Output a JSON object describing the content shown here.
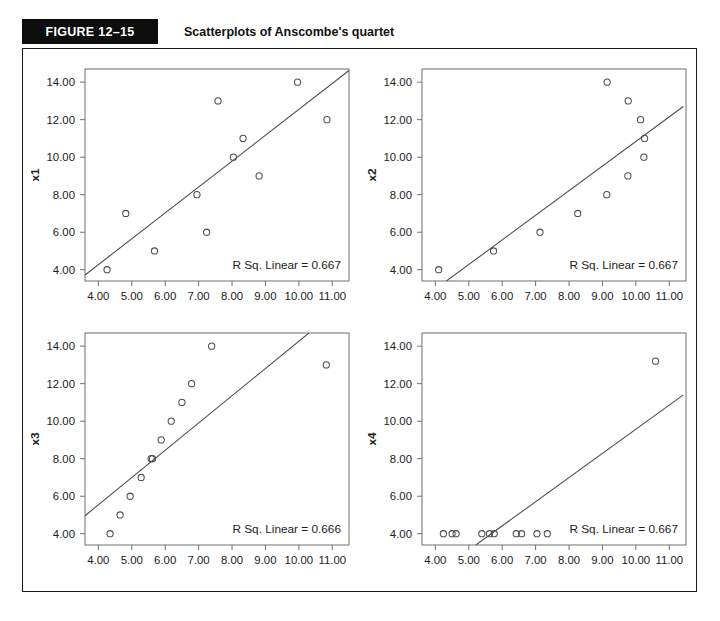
{
  "header": {
    "figure_tag": "FIGURE 12–15",
    "title": "Scatterplots of Anscombe's quartet"
  },
  "chart_data": [
    {
      "id": "panel-x1",
      "type": "scatter",
      "title": "",
      "xlabel": "",
      "ylabel": "x1",
      "xlim": [
        3.6,
        11.5
      ],
      "ylim": [
        3.4,
        14.7
      ],
      "xticks": [
        4.0,
        5.0,
        6.0,
        7.0,
        8.0,
        9.0,
        10.0,
        11.0
      ],
      "xticklabels": [
        "4.00",
        "5.00",
        "6.00",
        "7.00",
        "8.00",
        "9.00",
        "10.00",
        "11.00"
      ],
      "yticks": [
        4.0,
        6.0,
        8.0,
        10.0,
        12.0,
        14.0
      ],
      "yticklabels": [
        "4.00",
        "6.00",
        "8.00",
        "10.00",
        "12.00",
        "14.00"
      ],
      "grid": false,
      "annotation": "R Sq. Linear = 0.667",
      "points": [
        {
          "x": 4.26,
          "y": 4.0
        },
        {
          "x": 4.82,
          "y": 7.0
        },
        {
          "x": 5.68,
          "y": 5.0
        },
        {
          "x": 6.95,
          "y": 8.0
        },
        {
          "x": 7.24,
          "y": 6.0
        },
        {
          "x": 7.58,
          "y": 13.0
        },
        {
          "x": 8.04,
          "y": 10.0
        },
        {
          "x": 8.33,
          "y": 11.0
        },
        {
          "x": 8.81,
          "y": 9.0
        },
        {
          "x": 9.96,
          "y": 14.0
        },
        {
          "x": 10.84,
          "y": 12.0
        }
      ],
      "fit_line": {
        "x0": 3.6,
        "y0": 3.72,
        "x1": 11.5,
        "y1": 14.62
      }
    },
    {
      "id": "panel-x2",
      "type": "scatter",
      "title": "",
      "xlabel": "",
      "ylabel": "x2",
      "xlim": [
        3.6,
        11.5
      ],
      "ylim": [
        3.4,
        14.7
      ],
      "xticks": [
        4.0,
        5.0,
        6.0,
        7.0,
        8.0,
        9.0,
        10.0,
        11.0
      ],
      "xticklabels": [
        "4.00",
        "5.00",
        "6.00",
        "7.00",
        "8.00",
        "9.00",
        "10.00",
        "11.00"
      ],
      "yticks": [
        4.0,
        6.0,
        8.0,
        10.0,
        12.0,
        14.0
      ],
      "yticklabels": [
        "4.00",
        "6.00",
        "8.00",
        "10.00",
        "12.00",
        "14.00"
      ],
      "grid": false,
      "annotation": "R Sq. Linear = 0.667",
      "points": [
        {
          "x": 4.1,
          "y": 4.0
        },
        {
          "x": 5.74,
          "y": 5.0
        },
        {
          "x": 7.13,
          "y": 6.0
        },
        {
          "x": 8.26,
          "y": 7.0
        },
        {
          "x": 9.13,
          "y": 8.0
        },
        {
          "x": 9.14,
          "y": 14.0
        },
        {
          "x": 9.76,
          "y": 9.0
        },
        {
          "x": 9.77,
          "y": 13.0
        },
        {
          "x": 10.14,
          "y": 12.0
        },
        {
          "x": 10.24,
          "y": 10.0
        },
        {
          "x": 10.26,
          "y": 11.0
        }
      ],
      "fit_line": {
        "x0": 4.33,
        "y0": 3.4,
        "x1": 11.42,
        "y1": 12.7
      }
    },
    {
      "id": "panel-x3",
      "type": "scatter",
      "title": "",
      "xlabel": "",
      "ylabel": "x3",
      "xlim": [
        3.6,
        11.5
      ],
      "ylim": [
        3.4,
        14.7
      ],
      "xticks": [
        4.0,
        5.0,
        6.0,
        7.0,
        8.0,
        9.0,
        10.0,
        11.0
      ],
      "xticklabels": [
        "4.00",
        "5.00",
        "6.00",
        "7.00",
        "8.00",
        "9.00",
        "10.00",
        "11.00"
      ],
      "yticks": [
        4.0,
        6.0,
        8.0,
        10.0,
        12.0,
        14.0
      ],
      "yticklabels": [
        "4.00",
        "6.00",
        "8.00",
        "10.00",
        "12.00",
        "14.00"
      ],
      "grid": false,
      "annotation": "R Sq. Linear = 0.666",
      "points": [
        {
          "x": 4.35,
          "y": 4.0
        },
        {
          "x": 4.65,
          "y": 5.0
        },
        {
          "x": 4.95,
          "y": 6.0
        },
        {
          "x": 5.28,
          "y": 7.0
        },
        {
          "x": 5.58,
          "y": 8.0
        },
        {
          "x": 5.62,
          "y": 8.0
        },
        {
          "x": 5.88,
          "y": 9.0
        },
        {
          "x": 6.18,
          "y": 10.0
        },
        {
          "x": 6.5,
          "y": 11.0
        },
        {
          "x": 6.79,
          "y": 12.0
        },
        {
          "x": 7.39,
          "y": 14.0
        },
        {
          "x": 10.82,
          "y": 13.0
        }
      ],
      "fit_line": {
        "x0": 3.6,
        "y0": 4.96,
        "x1": 10.3,
        "y1": 14.7
      }
    },
    {
      "id": "panel-x4",
      "type": "scatter",
      "title": "",
      "xlabel": "",
      "ylabel": "x4",
      "xlim": [
        3.6,
        11.5
      ],
      "ylim": [
        3.4,
        14.7
      ],
      "xticks": [
        4.0,
        5.0,
        6.0,
        7.0,
        8.0,
        9.0,
        10.0,
        11.0
      ],
      "xticklabels": [
        "4.00",
        "5.00",
        "6.00",
        "7.00",
        "8.00",
        "9.00",
        "10.00",
        "11.00"
      ],
      "yticks": [
        4.0,
        6.0,
        8.0,
        10.0,
        12.0,
        14.0
      ],
      "yticklabels": [
        "4.00",
        "6.00",
        "8.00",
        "10.00",
        "12.00",
        "14.00"
      ],
      "grid": false,
      "annotation": "R Sq. Linear = 0.667",
      "points": [
        {
          "x": 4.24,
          "y": 4.0
        },
        {
          "x": 4.5,
          "y": 4.0
        },
        {
          "x": 4.62,
          "y": 4.0
        },
        {
          "x": 5.39,
          "y": 4.0
        },
        {
          "x": 5.62,
          "y": 4.0
        },
        {
          "x": 5.76,
          "y": 4.0
        },
        {
          "x": 6.42,
          "y": 4.0
        },
        {
          "x": 6.58,
          "y": 4.0
        },
        {
          "x": 7.04,
          "y": 4.0
        },
        {
          "x": 7.35,
          "y": 4.0
        },
        {
          "x": 10.59,
          "y": 13.2
        }
      ],
      "fit_line": {
        "x0": 5.21,
        "y0": 3.4,
        "x1": 11.42,
        "y1": 11.4
      }
    }
  ]
}
